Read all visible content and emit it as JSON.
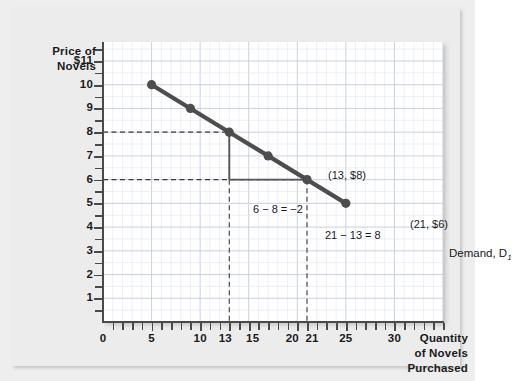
{
  "chart_data": {
    "type": "line",
    "title": "",
    "xlabel": "Quantity of Novels Purchased",
    "ylabel": "Price of Novels",
    "xlim": [
      0,
      35
    ],
    "ylim": [
      0,
      11.8
    ],
    "grid": true,
    "legend_position": "inline-right",
    "x_ticks": [
      "0",
      "5",
      "10",
      "13",
      "15",
      "20",
      "21",
      "25",
      "30"
    ],
    "x_tick_values": [
      0,
      5,
      10,
      13,
      15,
      20,
      21,
      25,
      30
    ],
    "y_ticks": [
      "1",
      "2",
      "3",
      "4",
      "5",
      "6",
      "7",
      "8",
      "9",
      "10",
      "$11"
    ],
    "y_tick_values": [
      1,
      2,
      3,
      4,
      5,
      6,
      7,
      8,
      9,
      10,
      11
    ],
    "series": [
      {
        "name": "Demand, D1",
        "x": [
          5,
          9,
          13,
          17,
          21,
          25
        ],
        "values": [
          10,
          9,
          8,
          7,
          6,
          5
        ],
        "color": "#4d4d4d",
        "marker": "filled-circle"
      }
    ],
    "annotations": [
      {
        "name": "point-a-label",
        "text": "(13, $8)",
        "x": 13,
        "y": 8
      },
      {
        "name": "point-b-label",
        "text": "(21, $6)",
        "x": 21,
        "y": 6
      },
      {
        "name": "rise-label",
        "text": "6 − 8 = −2",
        "x": 8,
        "y": 6.9
      },
      {
        "name": "run-label",
        "text": "21 − 13 = 8",
        "x": 17,
        "y": 5.6
      },
      {
        "name": "curve-label",
        "text": "Demand, D",
        "subscript": "1",
        "x": 25,
        "y": 5
      }
    ],
    "reference_lines": {
      "horizontal_dashed": [
        8,
        6
      ],
      "vertical_dashed": [
        13,
        21
      ]
    },
    "slope_triangle": {
      "vertical_segment": {
        "x": 13,
        "y_from": 8,
        "y_to": 6
      },
      "horizontal_segment": {
        "y": 6,
        "x_from": 13,
        "x_to": 21
      }
    }
  },
  "y_axis": {
    "title_line1": "Price of",
    "title_line2": "Novels"
  },
  "x_axis": {
    "title_line1": "Quantity",
    "title_line2": "of Novels",
    "title_line3": "Purchased"
  },
  "colors": {
    "curve": "#4d4d4d",
    "axis": "#4a4a4a",
    "grid_minor": "#dfe4ee",
    "grid_major": "#c3ccdd",
    "canvas": "#ffffff",
    "card": "#ececec",
    "text": "#1a1a1a"
  }
}
